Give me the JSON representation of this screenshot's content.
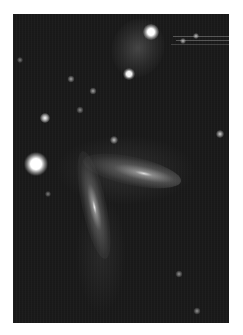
{
  "image": {
    "subject": "interacting galaxies star field",
    "palette": {
      "page_background": "#ffffff",
      "sky_background": "#1a1a1a",
      "galaxy_core": "#f4f4f4",
      "galaxy_halo": "#8a8a8a",
      "star_bright": "#ffffff"
    },
    "frame": {
      "left": 13,
      "top": 14,
      "width": 216,
      "height": 309
    },
    "objects": {
      "galaxies": [
        {
          "name": "upper-faint-galaxy",
          "cx": 138,
          "cy": 48,
          "rx": 26,
          "ry": 30,
          "rotate": 20,
          "brightness": 0.22
        },
        {
          "name": "central-galaxy-horizontal",
          "cx": 132,
          "cy": 170,
          "rx": 50,
          "ry": 13,
          "rotate": 12,
          "brightness": 0.55
        },
        {
          "name": "lower-galaxy-vertical",
          "cx": 94,
          "cy": 205,
          "rx": 12,
          "ry": 55,
          "rotate": -12,
          "brightness": 0.55
        }
      ],
      "stars": [
        {
          "name": "star-top-bright",
          "cx": 151,
          "cy": 32,
          "r": 5
        },
        {
          "name": "star-upper-mid",
          "cx": 129,
          "cy": 74,
          "r": 4
        },
        {
          "name": "star-left-bright",
          "cx": 36,
          "cy": 164,
          "r": 8
        },
        {
          "name": "star-left-small",
          "cx": 45,
          "cy": 118,
          "r": 3
        },
        {
          "name": "star-mid-small-1",
          "cx": 71,
          "cy": 79,
          "r": 2
        },
        {
          "name": "star-mid-small-2",
          "cx": 93,
          "cy": 91,
          "r": 2
        },
        {
          "name": "star-mid-small-3",
          "cx": 80,
          "cy": 110,
          "r": 2
        },
        {
          "name": "star-galaxy-top",
          "cx": 114,
          "cy": 140,
          "r": 3
        },
        {
          "name": "star-right",
          "cx": 220,
          "cy": 134,
          "r": 3
        },
        {
          "name": "star-far-left",
          "cx": 20,
          "cy": 60,
          "r": 2
        },
        {
          "name": "star-lower-right-1",
          "cx": 179,
          "cy": 274,
          "r": 2
        },
        {
          "name": "star-lower-right-2",
          "cx": 197,
          "cy": 311,
          "r": 2
        },
        {
          "name": "star-left-lower",
          "cx": 48,
          "cy": 194,
          "r": 2
        },
        {
          "name": "star-upper-right-trail",
          "cx": 196,
          "cy": 36,
          "r": 2
        }
      ]
    }
  }
}
